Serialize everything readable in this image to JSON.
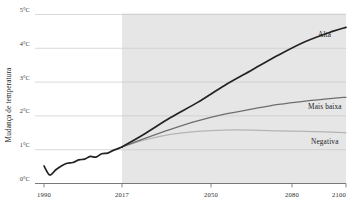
{
  "chart_data": {
    "type": "line",
    "title": "",
    "xlabel": "",
    "ylabel": "Mudança de temperatura",
    "ylim": [
      0,
      5
    ],
    "yticks": [
      0,
      1,
      2,
      3,
      4,
      5
    ],
    "ytick_labels": [
      "0°C",
      "1°C",
      "2°C",
      "3°C",
      "4°C",
      "5°C"
    ],
    "xticks": [
      1990,
      2017,
      2050,
      2080,
      2100
    ],
    "xtick_labels": [
      "1990",
      "2017",
      "2050",
      "2080",
      "2100"
    ],
    "grid": true,
    "legend_position": "inline-right",
    "projection_start": 2017,
    "annotations": [
      {
        "label": "Alta",
        "value": 4.6,
        "color": "#232323"
      },
      {
        "label": "Mais baixa",
        "value": 2.5,
        "color": "#6e6e6e"
      },
      {
        "label": "Negativa",
        "value": 1.5,
        "color": "#b4b4b4"
      }
    ],
    "series": [
      {
        "name": "Histórico",
        "color": "#232323",
        "x": [
          1990,
          1992,
          1994,
          1996,
          1998,
          2000,
          2002,
          2004,
          2006,
          2008,
          2010,
          2012,
          2014,
          2017
        ],
        "values": [
          0.52,
          0.25,
          0.4,
          0.52,
          0.6,
          0.62,
          0.7,
          0.72,
          0.8,
          0.78,
          0.88,
          0.9,
          0.98,
          1.08
        ]
      },
      {
        "name": "Alta",
        "color": "#232323",
        "x": [
          2017,
          2025,
          2035,
          2045,
          2055,
          2065,
          2075,
          2085,
          2095,
          2100
        ],
        "values": [
          1.08,
          1.45,
          1.95,
          2.4,
          2.9,
          3.35,
          3.8,
          4.2,
          4.5,
          4.62
        ]
      },
      {
        "name": "Mais baixa",
        "color": "#6e6e6e",
        "x": [
          2017,
          2025,
          2035,
          2045,
          2055,
          2065,
          2075,
          2085,
          2095,
          2100
        ],
        "values": [
          1.08,
          1.32,
          1.6,
          1.85,
          2.05,
          2.2,
          2.34,
          2.44,
          2.52,
          2.55
        ]
      },
      {
        "name": "Negativa",
        "color": "#b4b4b4",
        "x": [
          2017,
          2025,
          2035,
          2045,
          2055,
          2065,
          2075,
          2085,
          2095,
          2100
        ],
        "values": [
          1.08,
          1.28,
          1.45,
          1.54,
          1.58,
          1.58,
          1.56,
          1.54,
          1.52,
          1.5
        ]
      }
    ]
  },
  "axis": {
    "y_title": "Mudança de temperatura"
  }
}
